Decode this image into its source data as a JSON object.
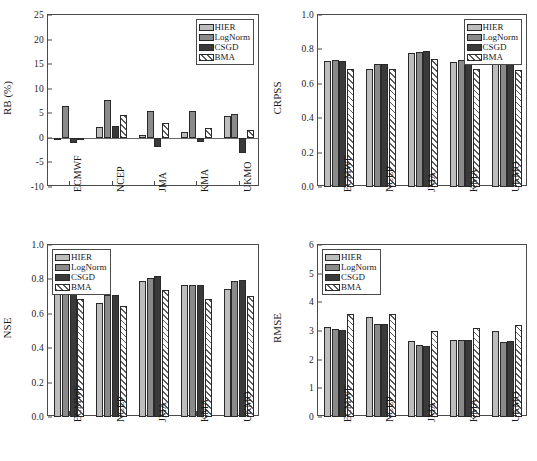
{
  "figure": {
    "panels": [
      "RB",
      "CRPSS",
      "NSE",
      "RMSE"
    ],
    "series_names": [
      "HIER",
      "LogNorm",
      "CSGD",
      "BMA"
    ],
    "categories": [
      "ECMWF",
      "NCEP",
      "JMA",
      "KMA",
      "UKMO"
    ],
    "colors": {
      "HIER": "#bdbdbd",
      "LogNorm": "#8a8a8a",
      "CSGD": "#3a3a3a",
      "BMA": "#ffffff",
      "axis": "#4a4a4a",
      "bar_outline": "#2a2a2a"
    }
  },
  "chart_data": [
    {
      "type": "bar",
      "title": "",
      "xlabel": "",
      "ylabel": "RB (%)",
      "categories": [
        "ECMWF",
        "NCEP",
        "JMA",
        "KMA",
        "UKMO"
      ],
      "series": [
        {
          "name": "HIER",
          "values": [
            -0.4,
            2.3,
            0.6,
            1.2,
            4.5
          ]
        },
        {
          "name": "LogNorm",
          "values": [
            6.5,
            7.7,
            5.4,
            5.4,
            4.8
          ]
        },
        {
          "name": "CSGD",
          "values": [
            -1.0,
            2.4,
            -1.8,
            -0.9,
            -3.0
          ]
        },
        {
          "name": "BMA",
          "values": [
            -0.3,
            4.6,
            3.1,
            2.0,
            1.5
          ]
        }
      ],
      "ylim": [
        -10,
        25
      ],
      "yticks": [
        -10,
        -5,
        0,
        5,
        10,
        15,
        20,
        25
      ],
      "ytick_labels": [
        "-10",
        "-5",
        "0",
        "5",
        "10",
        "15",
        "20",
        "25"
      ],
      "grid": false,
      "legend_position": "top-right",
      "legend_entries": [
        "HIER",
        "LogNorm",
        "CSGD",
        "BMA"
      ],
      "zero_line": true
    },
    {
      "type": "bar",
      "title": "",
      "xlabel": "",
      "ylabel": "CRPSS",
      "categories": [
        "ECMWF",
        "NCEP",
        "JMA",
        "KMA",
        "UKMO"
      ],
      "series": [
        {
          "name": "HIER",
          "values": [
            0.73,
            0.685,
            0.778,
            0.729,
            0.729
          ]
        },
        {
          "name": "LogNorm",
          "values": [
            0.736,
            0.718,
            0.786,
            0.741,
            0.74
          ]
        },
        {
          "name": "CSGD",
          "values": [
            0.734,
            0.718,
            0.789,
            0.74,
            0.737
          ]
        },
        {
          "name": "BMA",
          "values": [
            0.687,
            0.686,
            0.745,
            0.687,
            0.683
          ]
        }
      ],
      "ylim": [
        0.0,
        1.0
      ],
      "yticks": [
        0.0,
        0.2,
        0.4,
        0.6,
        0.8,
        1.0
      ],
      "ytick_labels": [
        "0.0",
        "0.2",
        "0.4",
        "0.6",
        "0.8",
        "1.0"
      ],
      "grid": false,
      "legend_position": "top-right",
      "legend_entries": [
        "HIER",
        "LogNorm",
        "CSGD",
        "BMA"
      ],
      "zero_line": false
    },
    {
      "type": "bar",
      "title": "",
      "xlabel": "",
      "ylabel": "NSE",
      "categories": [
        "ECMWF",
        "NCEP",
        "JMA",
        "KMA",
        "UKMO"
      ],
      "series": [
        {
          "name": "HIER",
          "values": [
            0.763,
            0.663,
            0.793,
            0.766,
            0.743
          ]
        },
        {
          "name": "LogNorm",
          "values": [
            0.766,
            0.71,
            0.81,
            0.769,
            0.793
          ]
        },
        {
          "name": "CSGD",
          "values": [
            0.779,
            0.711,
            0.818,
            0.767,
            0.797
          ]
        },
        {
          "name": "BMA",
          "values": [
            0.685,
            0.645,
            0.736,
            0.684,
            0.705
          ]
        }
      ],
      "ylim": [
        0.0,
        1.0
      ],
      "yticks": [
        0.0,
        0.2,
        0.4,
        0.6,
        0.8,
        1.0
      ],
      "ytick_labels": [
        "0.0",
        "0.2",
        "0.4",
        "0.6",
        "0.8",
        "1.0"
      ],
      "grid": false,
      "legend_position": "top-left",
      "legend_entries": [
        "HIER",
        "LogNorm",
        "CSGD",
        "BMA"
      ],
      "zero_line": false
    },
    {
      "type": "bar",
      "title": "",
      "xlabel": "",
      "ylabel": "RMSE",
      "categories": [
        "ECMWF",
        "NCEP",
        "JMA",
        "KMA",
        "UKMO"
      ],
      "series": [
        {
          "name": "HIER",
          "values": [
            3.13,
            3.5,
            2.64,
            2.67,
            3.0
          ]
        },
        {
          "name": "LogNorm",
          "values": [
            3.07,
            3.25,
            2.5,
            2.67,
            2.63
          ]
        },
        {
          "name": "CSGD",
          "values": [
            3.04,
            3.23,
            2.48,
            2.67,
            2.64
          ]
        },
        {
          "name": "BMA",
          "values": [
            3.59,
            3.61,
            3.01,
            3.1,
            3.21
          ]
        }
      ],
      "ylim": [
        0,
        6
      ],
      "yticks": [
        0,
        1,
        2,
        3,
        4,
        5,
        6
      ],
      "ytick_labels": [
        "0",
        "1",
        "2",
        "3",
        "4",
        "5",
        "6"
      ],
      "grid": false,
      "legend_position": "top-left",
      "legend_entries": [
        "HIER",
        "LogNorm",
        "CSGD",
        "BMA"
      ],
      "zero_line": false
    }
  ]
}
